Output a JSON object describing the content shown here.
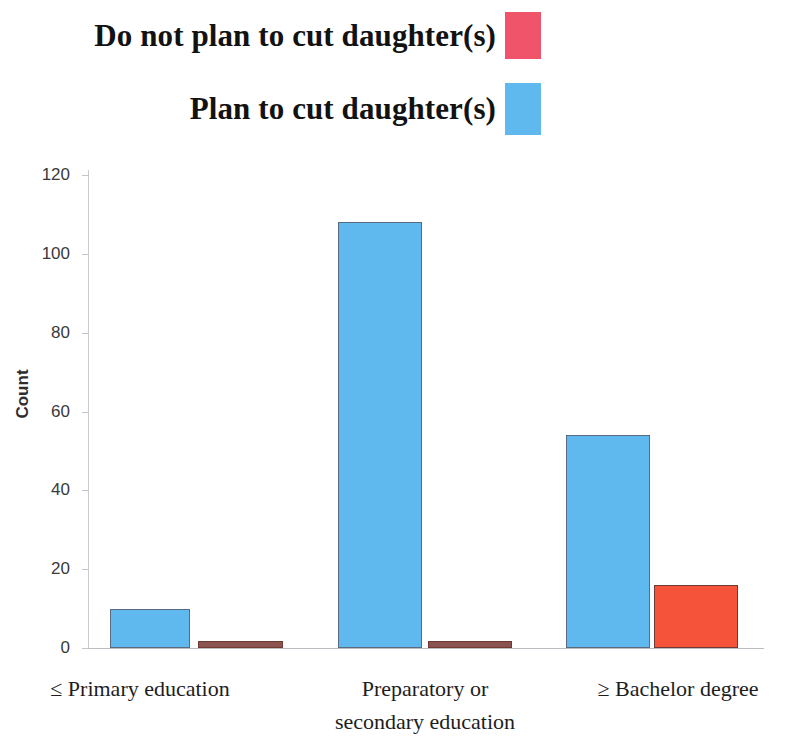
{
  "legend": {
    "position": "top-left",
    "entries": [
      {
        "label": "Do not plan to cut daughter(s)",
        "color": "#F0546B",
        "swatch_name": "legend-swatch-do-not-plan"
      },
      {
        "label": "Plan to cut daughter(s)",
        "color": "#5FB9EE",
        "swatch_name": "legend-swatch-plan"
      }
    ]
  },
  "axes": {
    "ylabel": "Count",
    "ytick_labels": [
      "120",
      "100",
      "80",
      "60",
      "40",
      "20",
      "0"
    ],
    "xtick_labels": [
      {
        "line1": "≤ Primary education",
        "line2": ""
      },
      {
        "line1": "Preparatory or",
        "line2": "secondary  education"
      },
      {
        "line1": "≥ Bachelor degree",
        "line2": ""
      }
    ]
  },
  "chart_data": {
    "type": "bar",
    "title": "",
    "subtitle": "",
    "xlabel": "",
    "ylabel": "Count",
    "ylim": [
      0,
      120
    ],
    "yticks": [
      0,
      20,
      40,
      60,
      80,
      100,
      120
    ],
    "grid": false,
    "legend_position": "top-left",
    "categories": [
      "≤ Primary education",
      "Preparatory or secondary education",
      "≥ Bachelor degree"
    ],
    "series": [
      {
        "name": "Plan to cut daughter(s)",
        "color": "#5FB9EE",
        "values": [
          10,
          108,
          54
        ]
      },
      {
        "name": "Do not plan to cut daughter(s)",
        "color": "#F5543A",
        "values": [
          1,
          1,
          16
        ]
      }
    ]
  },
  "colors": {
    "blue_fill": "#5FB9EE",
    "blue_edge": "#5A6B80",
    "red_fill": "#F5543A",
    "red_edge": "#6E3A33",
    "legend_red": "#F0546B",
    "axis": "#C2C6CA",
    "text": "#1D1D1D",
    "background": "#FFFFFF"
  }
}
